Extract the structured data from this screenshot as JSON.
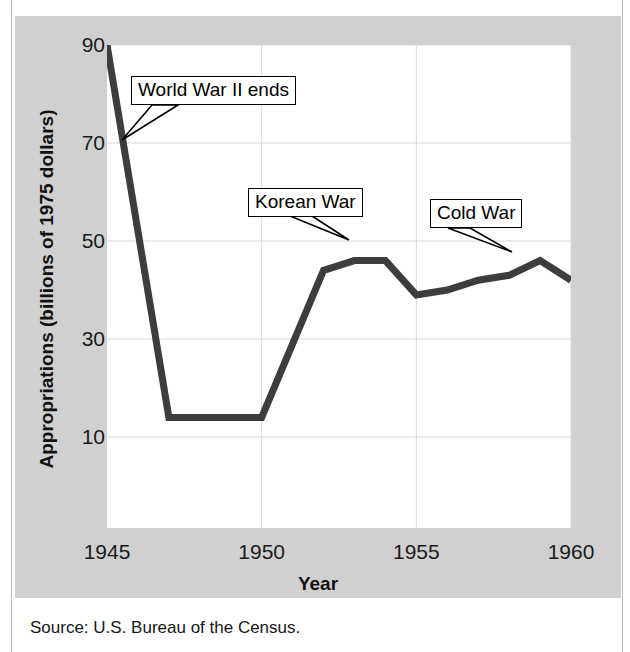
{
  "figure": {
    "source_note": "Source: U.S. Bureau of the Census."
  },
  "chart_data": {
    "type": "line",
    "title": "",
    "xlabel": "Year",
    "ylabel": "Appropriations (billions of 1975 dollars)",
    "xlim": [
      1945,
      1960
    ],
    "ylim": [
      0,
      95
    ],
    "xticks": [
      "1945",
      "1950",
      "1955",
      "1960"
    ],
    "xtick_values": [
      1945,
      1950,
      1955,
      1960
    ],
    "yticks": [
      "10",
      "30",
      "50",
      "70",
      "90"
    ],
    "ytick_values": [
      10,
      30,
      50,
      70,
      90
    ],
    "grid": "both",
    "legend": "none",
    "line_color": "#3d3d3d",
    "line_width": 7,
    "series": [
      {
        "name": "Appropriations",
        "x": [
          1945,
          1947,
          1950,
          1952,
          1953,
          1954,
          1955,
          1956,
          1957,
          1958,
          1959,
          1960
        ],
        "values": [
          90,
          14,
          14,
          44,
          46,
          46,
          39,
          40,
          42,
          43,
          46,
          42
        ]
      }
    ],
    "annotations": [
      {
        "label": "World War II ends",
        "box": {
          "x": 131,
          "y": 76,
          "width": 162,
          "height": 29
        },
        "pointer_from": {
          "x": 152,
          "y": 105
        },
        "pointer_to": {
          "x": 122,
          "y": 140
        }
      },
      {
        "label": "Korean War",
        "box": {
          "x": 248,
          "y": 188,
          "width": 113,
          "height": 28
        },
        "pointer_from": {
          "x": 312,
          "y": 216
        },
        "pointer_to": {
          "x": 349,
          "y": 240
        }
      },
      {
        "label": "Cold War",
        "box": {
          "x": 430,
          "y": 199,
          "width": 93,
          "height": 29
        },
        "pointer_from": {
          "x": 470,
          "y": 228
        },
        "pointer_to": {
          "x": 512,
          "y": 252
        }
      }
    ]
  }
}
